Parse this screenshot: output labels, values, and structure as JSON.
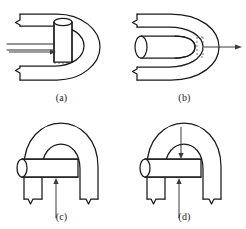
{
  "figure": {
    "background_color": "#ffffff",
    "line_color": "#1a1a1a",
    "dashed_color": "#6b6b6b",
    "arrow_color": "#3a3a3a",
    "panel_count": 4,
    "panels": [
      {
        "id": "a",
        "label": "(a)",
        "view": "perspective",
        "description": "Perspective view of parabolic U-channel with vertical cylinder at the throat and two horizontal approach lines entering from the left",
        "elements": [
          "parabolic-channel-outer",
          "parabolic-channel-inner",
          "vertical-cylinder",
          "cylinder-top-ellipse",
          "approach-lines",
          "approach-arrow",
          "dashed-hidden-edge",
          "break-mark-upper",
          "break-mark-lower"
        ]
      },
      {
        "id": "b",
        "label": "(b)",
        "view": "top",
        "description": "Top view of parabolic U-channel with bullet-nosed horizontal cylinder seated in the channel and an arrow pointing right through the apex",
        "elements": [
          "parabolic-channel-outer",
          "parabolic-channel-inner",
          "horizontal-cylinder",
          "cylinder-left-ellipse",
          "cylinder-nose",
          "dashed-gap-marker",
          "direction-arrow-right",
          "break-mark-upper",
          "break-mark-lower"
        ]
      },
      {
        "id": "c",
        "label": "(c)",
        "view": "front",
        "description": "Front view of inverted parabolic arch with a horizontal cylinder passing through it and an upward arrow from below",
        "elements": [
          "arch-outer",
          "arch-inner",
          "horizontal-cylinder",
          "cylinder-left-ellipse",
          "dashed-hidden-edge",
          "direction-arrow-up",
          "break-mark-left-leg",
          "break-mark-right-leg"
        ]
      },
      {
        "id": "d",
        "label": "(d)",
        "view": "front",
        "description": "Front view of inverted parabolic arch with horizontal cylinder, an upward arrow from below and a downward arrow from above converging on the cylinder",
        "elements": [
          "arch-outer",
          "arch-inner",
          "horizontal-cylinder",
          "cylinder-left-ellipse",
          "dashed-hidden-edge",
          "direction-arrow-up",
          "direction-arrow-down",
          "break-mark-left-leg",
          "break-mark-right-leg"
        ]
      }
    ]
  }
}
